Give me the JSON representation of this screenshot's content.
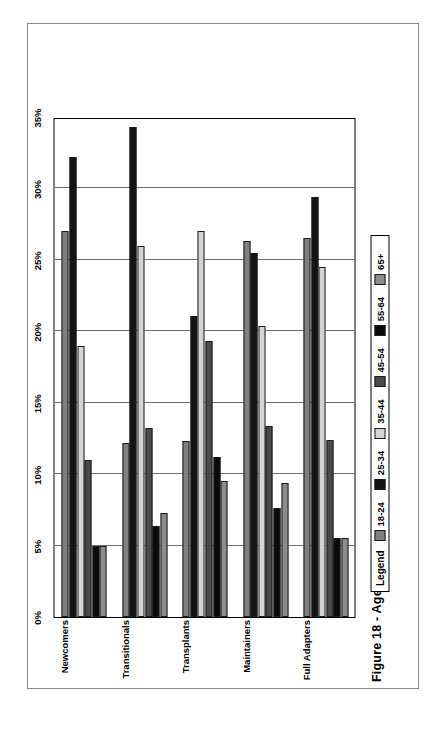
{
  "caption": "Figure 18 - Age Profile of U.S. Hispanic Generational Segments: 2000",
  "legend": {
    "title": "Legend",
    "entries": [
      {
        "label": "18-24",
        "color": "#808080"
      },
      {
        "label": "25-34",
        "color": "#141414"
      },
      {
        "label": "35-44",
        "color": "#d4d4d4"
      },
      {
        "label": "45-54",
        "color": "#4a4a4a"
      },
      {
        "label": "55-64",
        "color": "#0a0a0a"
      },
      {
        "label": "65+",
        "color": "#8c8c8c"
      }
    ]
  },
  "chart_data": {
    "type": "bar",
    "orientation": "horizontal",
    "title": "Figure 18 - Age Profile of U.S. Hispanic Generational Segments: 2000",
    "xlabel": "",
    "ylabel": "",
    "xlim": [
      0,
      35
    ],
    "xticks": [
      "0%",
      "5%",
      "10%",
      "15%",
      "20%",
      "25%",
      "30%",
      "35%"
    ],
    "xtick_values": [
      0,
      5,
      10,
      15,
      20,
      25,
      30,
      35
    ],
    "grid": true,
    "legend_position": "below-left",
    "categories": [
      "Newcomers",
      "Transitionals",
      "Transplants",
      "Maintainers",
      "Full Adapters"
    ],
    "series": [
      {
        "name": "18-24",
        "color": "#808080",
        "values": [
          27.0,
          12.2,
          12.3,
          26.3,
          26.5
        ]
      },
      {
        "name": "25-34",
        "color": "#141414",
        "values": [
          32.2,
          34.3,
          21.1,
          25.5,
          29.4
        ]
      },
      {
        "name": "35-44",
        "color": "#d4d4d4",
        "values": [
          19.0,
          26.0,
          27.0,
          20.4,
          24.5
        ]
      },
      {
        "name": "45-54",
        "color": "#4a4a4a",
        "values": [
          11.0,
          13.2,
          19.3,
          13.4,
          12.4
        ]
      },
      {
        "name": "55-64",
        "color": "#0a0a0a",
        "values": [
          5.0,
          6.4,
          11.2,
          7.6,
          5.5
        ]
      },
      {
        "name": "65+",
        "color": "#8c8c8c",
        "values": [
          5.0,
          7.3,
          9.5,
          9.4,
          5.5
        ]
      }
    ]
  }
}
